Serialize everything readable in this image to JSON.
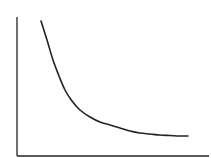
{
  "chart_data": {
    "type": "line",
    "title": "",
    "xlabel": "",
    "ylabel": "",
    "grid": false,
    "legend": null,
    "series": [
      {
        "name": "curve",
        "color": "#222222",
        "points_px": [
          [
            41,
            21
          ],
          [
            47,
            40
          ],
          [
            53,
            60
          ],
          [
            59,
            76
          ],
          [
            65,
            90
          ],
          [
            72,
            101
          ],
          [
            80,
            110
          ],
          [
            90,
            117
          ],
          [
            100,
            122
          ],
          [
            110,
            125
          ],
          [
            120,
            128
          ],
          [
            130,
            131
          ],
          [
            140,
            133
          ],
          [
            150,
            134
          ],
          [
            160,
            135
          ],
          [
            170,
            135.5
          ],
          [
            180,
            136
          ],
          [
            188,
            136
          ]
        ]
      }
    ],
    "axes": {
      "y_axis": {
        "x": 17,
        "y_top": 17,
        "y_bottom": 156
      },
      "x_axis": {
        "y": 156,
        "x_left": 17,
        "x_right": 209
      },
      "color": "#222222"
    }
  }
}
